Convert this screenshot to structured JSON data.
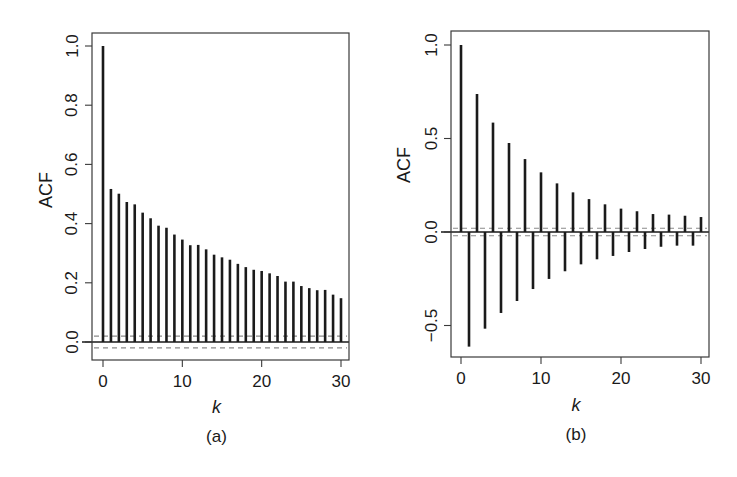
{
  "figure": {
    "panels": [
      {
        "id": "a",
        "caption": "(a)"
      },
      {
        "id": "b",
        "caption": "(b)"
      }
    ]
  },
  "chart_data": [
    {
      "type": "bar",
      "subtype": "acf-stem",
      "panel_caption": "(a)",
      "title": "",
      "xlabel": "k",
      "ylabel": "ACF",
      "xlim": [
        -1.2,
        31.2
      ],
      "ylim": [
        -0.06,
        1.04
      ],
      "xticks": [
        0,
        10,
        20,
        30
      ],
      "yticks": [
        0.0,
        0.2,
        0.4,
        0.6,
        0.8,
        1.0
      ],
      "ytick_labels": [
        "0.0",
        "0.2",
        "0.4",
        "0.6",
        "0.8",
        "1.0"
      ],
      "grid": false,
      "legend": null,
      "confidence_band": [
        -0.02,
        0.02
      ],
      "x": [
        0,
        1,
        2,
        3,
        4,
        5,
        6,
        7,
        8,
        9,
        10,
        11,
        12,
        13,
        14,
        15,
        16,
        17,
        18,
        19,
        20,
        21,
        22,
        23,
        24,
        25,
        26,
        27,
        28,
        29,
        30
      ],
      "values": [
        1.0,
        0.517,
        0.501,
        0.473,
        0.465,
        0.437,
        0.418,
        0.393,
        0.386,
        0.363,
        0.346,
        0.327,
        0.328,
        0.313,
        0.295,
        0.286,
        0.278,
        0.264,
        0.253,
        0.244,
        0.24,
        0.232,
        0.223,
        0.204,
        0.204,
        0.189,
        0.182,
        0.175,
        0.176,
        0.16,
        0.148
      ]
    },
    {
      "type": "bar",
      "subtype": "acf-stem",
      "panel_caption": "(b)",
      "title": "",
      "xlabel": "k",
      "ylabel": "ACF",
      "xlim": [
        -1.2,
        31.2
      ],
      "ylim": [
        -0.67,
        1.07
      ],
      "xticks": [
        0,
        10,
        20,
        30
      ],
      "yticks": [
        -0.5,
        0.0,
        0.5,
        1.0
      ],
      "ytick_labels": [
        "−0.5",
        "0.0",
        "0.5",
        "1.0"
      ],
      "grid": false,
      "legend": null,
      "confidence_band": [
        -0.02,
        0.02
      ],
      "x": [
        0,
        1,
        2,
        3,
        4,
        5,
        6,
        7,
        8,
        9,
        10,
        11,
        12,
        13,
        14,
        15,
        16,
        17,
        18,
        19,
        20,
        21,
        22,
        23,
        24,
        25,
        26,
        27,
        28,
        29,
        30
      ],
      "values": [
        1.0,
        -0.613,
        0.738,
        -0.517,
        0.585,
        -0.433,
        0.476,
        -0.369,
        0.39,
        -0.305,
        0.319,
        -0.251,
        0.26,
        -0.21,
        0.212,
        -0.173,
        0.176,
        -0.146,
        0.148,
        -0.128,
        0.125,
        -0.107,
        0.111,
        -0.091,
        0.096,
        -0.079,
        0.093,
        -0.073,
        0.087,
        -0.073,
        0.08
      ]
    }
  ],
  "layout": {
    "panels": [
      {
        "frame": [
          92,
          33,
          349,
          360
        ],
        "x0px": 103,
        "x30px": 341,
        "y_at_0": 342,
        "y_at_1": 46,
        "ylabel_x": 46,
        "ylabel_y": 190,
        "tick_label_x": 72,
        "caption_y": 442,
        "xlabel_y": 413
      },
      {
        "frame": [
          451,
          31,
          709,
          357
        ],
        "x0px": 461,
        "x30px": 701,
        "y_at_0": 232,
        "y_at_1": 45,
        "ylabel_x": 404,
        "ylabel_y": 165,
        "tick_label_x": 431,
        "caption_y": 440,
        "xlabel_y": 411
      }
    ],
    "colors": {
      "bar": "#1a1a1a",
      "frame": "#3a3a3a",
      "band": "#8a8a8a",
      "text": "#1a1a1a"
    }
  }
}
